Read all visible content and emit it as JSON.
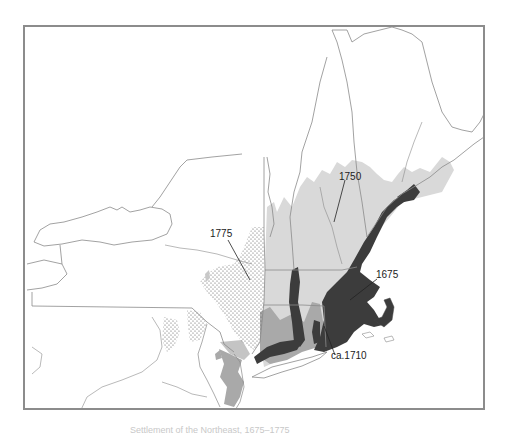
{
  "map": {
    "title": "Spread of settlement in New England and New York",
    "region": "Northeastern United States (New England, New York, New Jersey, Pennsylvania)",
    "colors": {
      "frame": "#8c8c8c",
      "boundary": "#8a8a8a",
      "settled_1675": "#3c3c3c",
      "settled_1710": "#a9a9a9",
      "settled_1750": "#d9d9d9",
      "settled_1775": "stipple",
      "background": "#ffffff"
    },
    "labels": [
      {
        "id": "1750",
        "text": "1750"
      },
      {
        "id": "1775",
        "text": "1775"
      },
      {
        "id": "1675",
        "text": "1675"
      },
      {
        "id": "1710",
        "text": "ca.1710"
      }
    ]
  },
  "caption": {
    "text": "Settlement of the Northeast, 1675–1775"
  }
}
